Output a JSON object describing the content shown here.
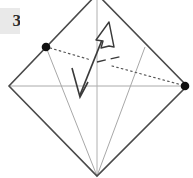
{
  "figure": {
    "label_partial": "3",
    "caption": "",
    "type": "origami-fold-diagram"
  },
  "colors": {
    "outline": "#4a4a4a",
    "crease": "#a8a8a8",
    "dot": "#111111",
    "arrow": "#333333",
    "dotted": "#555555",
    "background": "#ffffff",
    "label_bg": "#e9e9e9"
  },
  "geometry": {
    "sheet": {
      "name": "diamond-outline",
      "points": "97,-6 187,86 97,176 9,86"
    },
    "creases": [
      {
        "name": "crease-horizontal-midline",
        "x1": 9,
        "y1": 86,
        "x2": 187,
        "y2": 86
      },
      {
        "name": "crease-vertical-midline",
        "x1": 97,
        "y1": -6,
        "x2": 97,
        "y2": 176
      },
      {
        "name": "crease-left-diagonal",
        "x1": 46,
        "y1": 47,
        "x2": 97,
        "y2": 176
      },
      {
        "name": "crease-right-diagonal",
        "x1": 145,
        "y1": 47,
        "x2": 97,
        "y2": 176
      }
    ],
    "dots": [
      {
        "name": "reference-point-left",
        "cx": 46,
        "cy": 47,
        "r": 4.2
      },
      {
        "name": "reference-point-right",
        "cx": 185,
        "cy": 86,
        "r": 4.2
      }
    ],
    "dotted_guide": {
      "name": "alignment-dotted-line",
      "segments": [
        {
          "x1": 50,
          "y1": 48,
          "x2": 90,
          "y2": 59
        },
        {
          "x1": 112,
          "y1": 64,
          "x2": 182,
          "y2": 84
        }
      ],
      "dash": "1.6 3.2"
    },
    "dash_tick": {
      "name": "fold-axis-dash",
      "x1": 96,
      "y1": 63,
      "x2": 123,
      "y2": 57
    },
    "arrow": {
      "name": "fold-direction-arrow",
      "shaft": {
        "x1": 79,
        "y1": 94,
        "x2": 107,
        "y2": 28
      },
      "head_up": {
        "points": "107,23 98,41 112,45",
        "style": "hollow"
      },
      "head_down": {
        "points": "79,97 73,69 88,84",
        "style": "thin-v"
      }
    }
  }
}
